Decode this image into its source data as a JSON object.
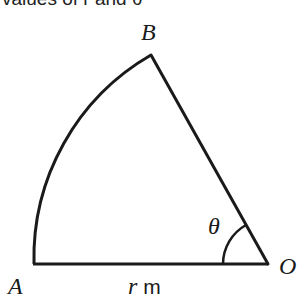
{
  "caption": "values of r and θ",
  "figure": {
    "type": "sector",
    "points": {
      "A": {
        "label": "A"
      },
      "B": {
        "label": "B"
      },
      "O": {
        "label": "O"
      }
    },
    "angle_label": "θ",
    "radius_label_var": "r",
    "radius_label_unit": " m",
    "stroke_color": "#1a1a1a"
  }
}
